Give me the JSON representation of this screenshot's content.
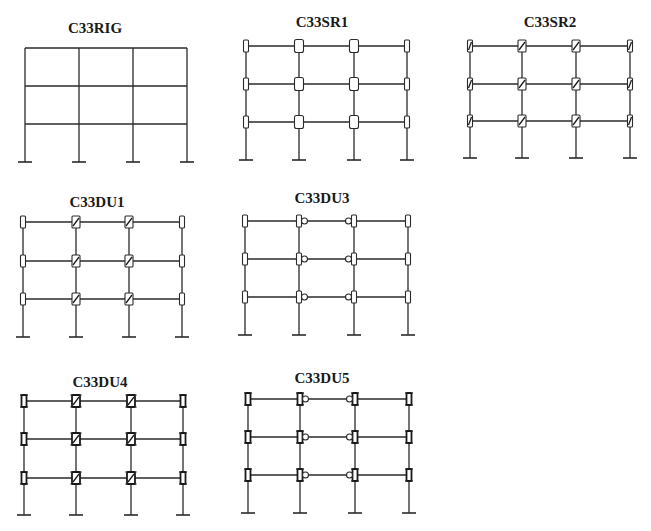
{
  "figure": {
    "colors": {
      "line": "#2a2a2a",
      "background": "#ffffff"
    }
  },
  "frames": [
    {
      "id": "C33RIG",
      "label": "C33RIG",
      "connection_type": "rigid",
      "title_pos": [
        95,
        33
      ],
      "columns_x": [
        25,
        79,
        133,
        187
      ],
      "beams_y": [
        48,
        86,
        124
      ],
      "base_y": 162,
      "edge_joint": "none",
      "inner_joint": "none"
    },
    {
      "id": "C33SR1",
      "label": "C33SR1",
      "connection_type": "semi-rigid-1",
      "title_pos": [
        322,
        27
      ],
      "columns_x": [
        246,
        299,
        354,
        407
      ],
      "beams_y": [
        46,
        84,
        122
      ],
      "base_y": 160,
      "edge_joint": "rect",
      "inner_joint": "rect-wide"
    },
    {
      "id": "C33SR2",
      "label": "C33SR2",
      "connection_type": "semi-rigid-2",
      "title_pos": [
        550,
        27
      ],
      "columns_x": [
        470,
        522,
        576,
        630
      ],
      "beams_y": [
        46,
        84,
        121
      ],
      "base_y": 158,
      "edge_joint": "rect-diag",
      "inner_joint": "rect-diag"
    },
    {
      "id": "C33DU1",
      "label": "C33DU1",
      "connection_type": "dual-1",
      "title_pos": [
        97,
        207
      ],
      "columns_x": [
        23,
        76,
        129,
        182
      ],
      "beams_y": [
        222,
        261,
        299
      ],
      "base_y": 337,
      "edge_joint": "rect",
      "inner_joint": "rect-diag"
    },
    {
      "id": "C33DU3",
      "label": "C33DU3",
      "connection_type": "dual-3",
      "title_pos": [
        322,
        203
      ],
      "columns_x": [
        245,
        299,
        354,
        408
      ],
      "beams_y": [
        221,
        259,
        297
      ],
      "base_y": 335,
      "edge_joint": "rect",
      "inner_joint": "rect-pin"
    },
    {
      "id": "C33DU4",
      "label": "C33DU4",
      "connection_type": "dual-4",
      "title_pos": [
        100,
        387
      ],
      "columns_x": [
        24,
        76,
        131,
        183
      ],
      "beams_y": [
        401,
        439,
        478
      ],
      "base_y": 515,
      "edge_joint": "rect-bold",
      "inner_joint": "rect-diag-bold"
    },
    {
      "id": "C33DU5",
      "label": "C33DU5",
      "connection_type": "dual-5",
      "title_pos": [
        322,
        383
      ],
      "columns_x": [
        248,
        300,
        355,
        409
      ],
      "beams_y": [
        399,
        437,
        475
      ],
      "base_y": 513,
      "edge_joint": "rect-bold",
      "inner_joint": "rect-pin-bold"
    }
  ],
  "legend": {
    "joint_glyphs": {
      "none": "rigid connection (plain intersection)",
      "rect": "small rectangle at beam end",
      "rect-wide": "wider rectangle spanning column",
      "rect-diag": "rectangle with diagonal slash",
      "rect-pin": "rectangle with round pin on beam side",
      "rect-bold": "rectangle with thick top/bottom plates",
      "rect-diag-bold": "slashed rectangle with thick plates",
      "rect-pin-bold": "pinned rectangle with thick plates"
    }
  }
}
